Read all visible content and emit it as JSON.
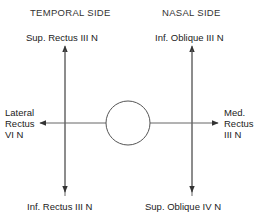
{
  "headers": {
    "left": "TEMPORAL SIDE",
    "right": "NASAL SIDE"
  },
  "labels": {
    "top_left": "Sup. Rectus III N",
    "top_right": "Inf. Oblique III N",
    "bottom_left": "Inf. Rectus III N",
    "bottom_right": "Sup. Oblique IV N",
    "left": [
      "Lateral",
      "Rectus",
      "VI N"
    ],
    "right": [
      "Med.",
      "Rectus",
      "III N"
    ]
  },
  "colors": {
    "line": "#555555",
    "text": "#222222"
  }
}
